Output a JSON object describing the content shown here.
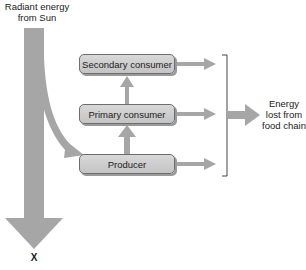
{
  "source": {
    "label_line1": "Radiant energy",
    "label_line2": "from Sun"
  },
  "nodes": [
    {
      "id": "secondary",
      "label": "Secondary consumer"
    },
    {
      "id": "primary",
      "label": "Primary consumer"
    },
    {
      "id": "producer",
      "label": "Producer"
    }
  ],
  "loss": {
    "line1": "Energy",
    "line2": "lost from",
    "line3": "food chain"
  },
  "sink": {
    "label": "X"
  },
  "colors": {
    "arrow": "#a6a6a6",
    "box_fill": "#cfcfcf",
    "box_border": "#6d6d6d",
    "bracket": "#444444"
  }
}
